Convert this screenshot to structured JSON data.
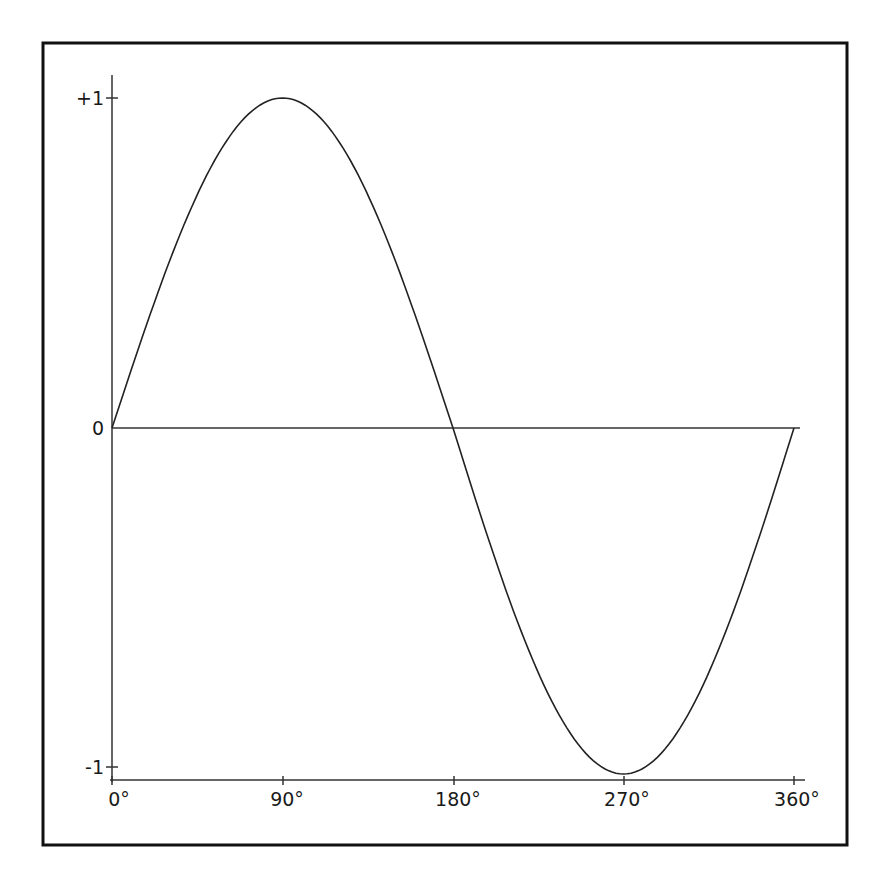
{
  "chart_data": {
    "type": "line",
    "title": "",
    "xlabel": "",
    "ylabel": "",
    "x_tick_labels": [
      "0°",
      "90°",
      "180°",
      "270°",
      "360°"
    ],
    "x_ticks": [
      0,
      90,
      180,
      270,
      360
    ],
    "y_tick_labels": [
      "+1",
      "0",
      "-1"
    ],
    "y_ticks": [
      1,
      0,
      -1
    ],
    "xlim": [
      0,
      360
    ],
    "ylim": [
      -1,
      1
    ],
    "grid": false,
    "legend": null,
    "series": [
      {
        "name": "sine wave",
        "x": [
          0,
          30,
          60,
          90,
          120,
          150,
          180,
          210,
          240,
          270,
          300,
          330,
          360
        ],
        "values": [
          0,
          0.5,
          0.866,
          1,
          0.866,
          0.5,
          0,
          -0.5,
          -0.866,
          -1,
          -0.866,
          -0.5,
          0
        ]
      }
    ],
    "colors": {
      "line": "#222222",
      "axes": "#222222",
      "frame": "#111111",
      "background": "#ffffff"
    }
  }
}
